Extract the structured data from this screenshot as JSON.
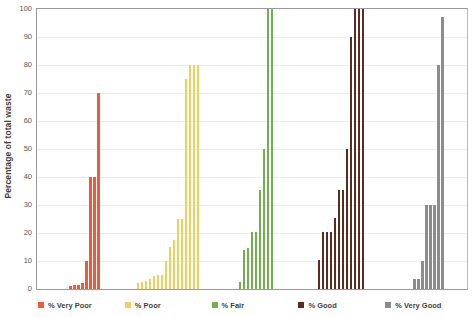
{
  "chart_data": {
    "type": "bar",
    "title": "",
    "subtitle": "",
    "xlabel": "",
    "ylabel": "Percentage of total waste",
    "ylim": [
      0,
      100
    ],
    "yticks": [
      0,
      10,
      20,
      30,
      40,
      50,
      60,
      70,
      80,
      90,
      100
    ],
    "ytick_labels": [
      "0",
      "10",
      "20",
      "30",
      "40",
      "50",
      "60",
      "70",
      "80",
      "90",
      "100"
    ],
    "grid": true,
    "grid_axis": "y",
    "legend_position": "bottom",
    "xticks_visible": false,
    "series": [
      {
        "name": "% Very Poor",
        "color": "#EC5B3A",
        "values": [
          1,
          1.5,
          1.5,
          2,
          10,
          40,
          40,
          70
        ]
      },
      {
        "name": "% Poor",
        "color": "#F2CE5C",
        "values": [
          2,
          2.5,
          3,
          3.5,
          4.5,
          5,
          5,
          10,
          15,
          17.5,
          25,
          25,
          75,
          80,
          80,
          80
        ]
      },
      {
        "name": "% Fair",
        "color": "#6FB14A",
        "values": [
          2.5,
          14,
          14.5,
          20.5,
          20.5,
          35.5,
          50,
          100,
          100
        ]
      },
      {
        "name": "% Good",
        "color": "#5D2B1E",
        "values": [
          10.5,
          20.5,
          20.5,
          20.5,
          25.5,
          35.5,
          35.5,
          50,
          90,
          100,
          100,
          100
        ]
      },
      {
        "name": "% Very Good",
        "color": "#8C8C8C",
        "values": [
          3.5,
          3.5,
          10,
          30,
          30,
          30,
          80,
          97
        ]
      }
    ]
  },
  "legend": {
    "items": [
      {
        "label": "% Very Poor",
        "color": "#EC5B3A"
      },
      {
        "label": "% Poor",
        "color": "#F2CE5C"
      },
      {
        "label": "% Fair",
        "color": "#6FB14A"
      },
      {
        "label": "% Good",
        "color": "#5D2B1E"
      },
      {
        "label": "% Very Good",
        "color": "#8C8C8C"
      }
    ]
  },
  "axes": {
    "y_title": "Percentage of total waste"
  }
}
